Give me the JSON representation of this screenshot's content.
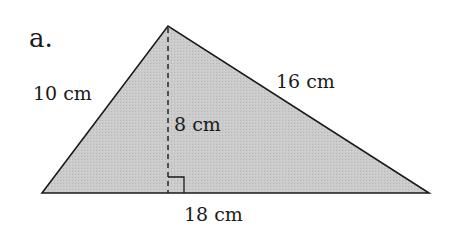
{
  "figure": {
    "part_label": "a.",
    "shape": "triangle",
    "fill_color": "#c8c8c8",
    "stroke_color": "#1a1a1a",
    "labels": {
      "left_side": "10 cm",
      "right_side": "16 cm",
      "height": "8 cm",
      "base": "18 cm"
    },
    "right_angle_marker": true,
    "height_line_style": "dashed"
  }
}
